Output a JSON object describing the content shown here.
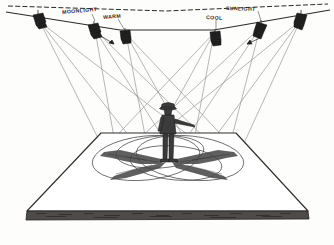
{
  "diagram": {
    "medium": "pen-and-ink line illustration, black on white"
  },
  "instrument_labels": [
    {
      "name": "moonlight-label",
      "text": "MOONLIGHT",
      "x": 62,
      "y": 11
    },
    {
      "name": "warm-label",
      "text": "WARM",
      "x": 103,
      "y": 15
    },
    {
      "name": "cool-label",
      "text": "COOL",
      "x": 206,
      "y": 15
    },
    {
      "name": "sunlight-label",
      "text": "SUNLIGHT",
      "x": 228,
      "y": 6
    }
  ],
  "fixtures": [
    {
      "name": "fixture-far-left",
      "label": "",
      "x": 36,
      "y": 16,
      "angle": 28
    },
    {
      "name": "fixture-moonlight",
      "label": "MOONLIGHT",
      "x": 92,
      "y": 23,
      "angle": 32
    },
    {
      "name": "fixture-warm",
      "label": "WARM",
      "x": 124,
      "y": 28,
      "angle": 8
    },
    {
      "name": "fixture-cool",
      "label": "COOL",
      "x": 216,
      "y": 27,
      "angle": -8
    },
    {
      "name": "fixture-sunlight",
      "label": "SUNLIGHT",
      "x": 262,
      "y": 21,
      "angle": -34
    },
    {
      "name": "fixture-far-right",
      "label": "",
      "x": 302,
      "y": 14,
      "angle": -28
    }
  ],
  "battens": [
    {
      "name": "batten-upper",
      "note": "upper pipe, dashed, spans full width"
    },
    {
      "name": "batten-lower",
      "note": "lower pipe, dips toward center"
    }
  ],
  "performer": {
    "name": "performer-figure",
    "pose": "standing, wearing a hat, right arm extended",
    "x": 168,
    "y": 128
  },
  "platform": {
    "name": "stage-platform",
    "shape": "trapezoid in perspective",
    "front_edge": "thick dark band"
  },
  "light_pools": [
    {
      "name": "light-pool-1"
    },
    {
      "name": "light-pool-2"
    },
    {
      "name": "light-pool-3"
    },
    {
      "name": "light-pool-4"
    }
  ],
  "shadows": [
    {
      "name": "shadow-left-far"
    },
    {
      "name": "shadow-left-near"
    },
    {
      "name": "shadow-right-near"
    },
    {
      "name": "shadow-right-far"
    }
  ],
  "colors": {
    "ink": "#222222",
    "ink_soft": "#555555",
    "beam": "#8c8c8c",
    "paper": "#fdfdfc",
    "shadow_fill": "#4a4a4a"
  }
}
